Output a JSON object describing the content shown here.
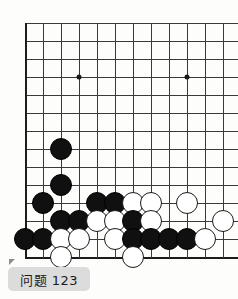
{
  "caption": {
    "label": "问题 123",
    "corner_marker": "triangle-marker"
  },
  "board": {
    "type": "go-board-diagram",
    "cols": 12,
    "rows": 14,
    "cell_size": 18,
    "origin_x": 25,
    "origin_y": 23,
    "line_color": "#3a3a3a",
    "edge_color": "#1c1c1c",
    "background_color": "#fdfdfb",
    "black_color": "#101010",
    "white_color": "#ffffff",
    "star_points": [
      {
        "col": 3,
        "row": 3
      },
      {
        "col": 9,
        "row": 3
      }
    ],
    "edges": {
      "left": true,
      "bottom": true,
      "top": false,
      "right": false
    },
    "stones": [
      {
        "col": 2,
        "row": 7,
        "color": "black"
      },
      {
        "col": 2,
        "row": 9,
        "color": "black"
      },
      {
        "col": 1,
        "row": 10,
        "color": "black"
      },
      {
        "col": 2,
        "row": 11,
        "color": "black"
      },
      {
        "col": 3,
        "row": 11,
        "color": "black"
      },
      {
        "col": 0,
        "row": 12,
        "color": "black"
      },
      {
        "col": 1,
        "row": 12,
        "color": "black"
      },
      {
        "col": 4,
        "row": 10,
        "color": "black"
      },
      {
        "col": 5,
        "row": 10,
        "color": "black"
      },
      {
        "col": 6,
        "row": 10,
        "color": "white"
      },
      {
        "col": 7,
        "row": 10,
        "color": "white"
      },
      {
        "col": 9,
        "row": 10,
        "color": "white"
      },
      {
        "col": 4,
        "row": 11,
        "color": "white"
      },
      {
        "col": 5,
        "row": 11,
        "color": "white"
      },
      {
        "col": 6,
        "row": 11,
        "color": "black"
      },
      {
        "col": 7,
        "row": 11,
        "color": "white"
      },
      {
        "col": 11,
        "row": 11,
        "color": "white"
      },
      {
        "col": 2,
        "row": 12,
        "color": "white"
      },
      {
        "col": 3,
        "row": 12,
        "color": "white"
      },
      {
        "col": 5,
        "row": 12,
        "color": "white"
      },
      {
        "col": 6,
        "row": 12,
        "color": "black"
      },
      {
        "col": 7,
        "row": 12,
        "color": "black"
      },
      {
        "col": 8,
        "row": 12,
        "color": "black"
      },
      {
        "col": 9,
        "row": 12,
        "color": "black"
      },
      {
        "col": 10,
        "row": 12,
        "color": "white"
      },
      {
        "col": 2,
        "row": 13,
        "color": "white"
      },
      {
        "col": 6,
        "row": 13,
        "color": "white"
      }
    ]
  }
}
